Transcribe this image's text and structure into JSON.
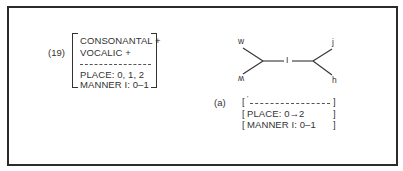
{
  "example_number": "(19)",
  "feature_matrix": {
    "rows_top": [
      "CONSONANTAL +",
      "VOCALIC +"
    ],
    "rows_bottom": [
      "PLACE: 0, 1, 2",
      "MANNER I: 0–1"
    ]
  },
  "tree": {
    "nodes": {
      "top_left": "w",
      "bottom_left": "ʍ",
      "center": "I",
      "top_right": "j",
      "bottom_right": "h"
    }
  },
  "sub_example": {
    "label": "(a)",
    "open_bracket": "[",
    "close_bracket": "]",
    "tick": "'",
    "rows": [
      "PLACE: 0→2",
      "MANNER I: 0–1"
    ]
  }
}
